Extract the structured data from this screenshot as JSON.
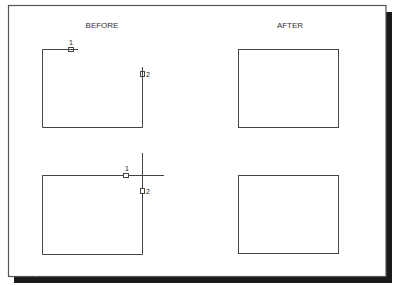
{
  "diagram": {
    "colors": {
      "frame": "#555555",
      "shadow": "#1a1a1a",
      "line": "#444444",
      "background": "#ffffff"
    },
    "column_headers": {
      "before": "BEFORE",
      "after": "AFTER"
    },
    "panels": [
      {
        "id": "top-before",
        "column": "before",
        "description": "Open rectangle with a gap at upper-right corner; top edge ends at pick point 1, right edge starts below pick point 2",
        "pick_points": [
          {
            "label": "1"
          },
          {
            "label": "2"
          }
        ]
      },
      {
        "id": "top-after",
        "column": "after",
        "description": "Closed rectangle (corner filleted/joined)"
      },
      {
        "id": "bottom-before",
        "column": "before",
        "description": "Rectangle with top and right edges overshooting past the corner; pick points 1 and 2",
        "pick_points": [
          {
            "label": "1"
          },
          {
            "label": "2"
          }
        ]
      },
      {
        "id": "bottom-after",
        "column": "after",
        "description": "Closed rectangle (overshoots trimmed)"
      }
    ]
  }
}
